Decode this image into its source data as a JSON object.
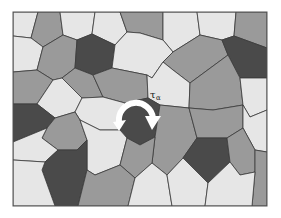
{
  "figure": {
    "colors": {
      "light": "#e6e6e6",
      "medium": "#9a9a9a",
      "dark": "#4a4a4a",
      "boundary": "#3a3a3a",
      "arrow": "#ffffff",
      "background": "#ffffff"
    },
    "label": {
      "symbol": "τ",
      "subscript": "α"
    },
    "rotation_arrow": {
      "direction": "clockwise",
      "color": "#ffffff"
    }
  }
}
